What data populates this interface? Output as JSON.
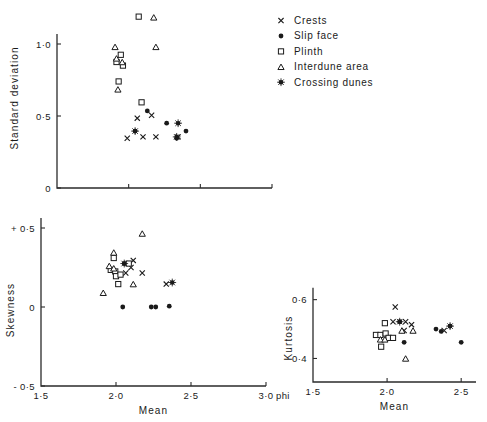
{
  "figure": {
    "title": "",
    "phi_unit": "phi"
  },
  "legend": {
    "position": "top-right",
    "items": [
      {
        "label": "Crests",
        "marker": "cross-x",
        "icon": "x-marker-icon"
      },
      {
        "label": "Slip face",
        "marker": "filled-circle",
        "icon": "filled-circle-icon"
      },
      {
        "label": "Plinth",
        "marker": "open-square",
        "icon": "open-square-icon"
      },
      {
        "label": "Interdune area",
        "marker": "open-triangle",
        "icon": "open-triangle-icon"
      },
      {
        "label": "Crossing dunes",
        "marker": "star-dot",
        "icon": "star-dot-icon"
      }
    ]
  },
  "chart_data": [
    {
      "id": "standard-deviation",
      "type": "scatter",
      "title": "",
      "xlabel": "",
      "ylabel": "Standard  deviation",
      "xlim": [
        1.5,
        3.0
      ],
      "ylim": [
        0.0,
        1.25
      ],
      "xticks": [
        1.5,
        2.0,
        2.5,
        3.0
      ],
      "xticklabels": [
        "",
        "",
        "",
        ""
      ],
      "yticks": [
        0.0,
        0.5,
        1.0
      ],
      "yticklabels": [
        "0",
        "0·5",
        "1·0"
      ],
      "grid": false,
      "series": [
        {
          "name": "Crests",
          "marker": "cross-x",
          "points": [
            [
              2.06,
              0.485
            ],
            [
              2.16,
              0.505
            ],
            [
              1.99,
              0.345
            ],
            [
              2.1,
              0.355
            ],
            [
              2.19,
              0.355
            ],
            [
              2.345,
              0.355
            ]
          ]
        },
        {
          "name": "Slip face",
          "marker": "filled-circle",
          "points": [
            [
              2.13,
              0.535
            ],
            [
              2.045,
              0.395
            ],
            [
              2.265,
              0.45
            ],
            [
              2.335,
              0.345
            ],
            [
              2.4,
              0.395
            ]
          ]
        },
        {
          "name": "Plinth",
          "marker": "open-square",
          "points": [
            [
              2.07,
              1.19
            ],
            [
              1.945,
              0.925
            ],
            [
              1.915,
              0.875
            ],
            [
              1.96,
              0.85
            ],
            [
              1.93,
              0.74
            ],
            [
              2.09,
              0.595
            ]
          ]
        },
        {
          "name": "Interdune area",
          "marker": "open-triangle",
          "points": [
            [
              2.175,
              1.185
            ],
            [
              1.905,
              0.98
            ],
            [
              2.19,
              0.98
            ],
            [
              1.915,
              0.9
            ],
            [
              1.955,
              0.875
            ],
            [
              1.925,
              0.685
            ]
          ]
        },
        {
          "name": "Crossing dunes",
          "marker": "star-dot",
          "points": [
            [
              2.045,
              0.395
            ],
            [
              2.335,
              0.355
            ],
            [
              2.345,
              0.45
            ]
          ]
        }
      ]
    },
    {
      "id": "skewness",
      "type": "scatter",
      "title": "",
      "xlabel": "Mean",
      "ylabel": "Skewness",
      "xlim": [
        1.5,
        3.0
      ],
      "ylim": [
        -0.5,
        0.5
      ],
      "xticks": [
        1.5,
        2.0,
        2.5,
        3.0
      ],
      "xticklabels": [
        "1·5",
        "2·0",
        "2·5",
        "3·0"
      ],
      "yticks": [
        -0.5,
        0.0,
        0.5
      ],
      "yticklabels": [
        "- 0·5",
        "0",
        "+ 0·5"
      ],
      "grid": false,
      "series": [
        {
          "name": "Crests",
          "marker": "cross-x",
          "points": [
            [
              2.115,
              0.295
            ],
            [
              2.1,
              0.25
            ],
            [
              2.065,
              0.215
            ],
            [
              2.175,
              0.215
            ],
            [
              2.335,
              0.145
            ]
          ]
        },
        {
          "name": "Slip face",
          "marker": "filled-circle",
          "points": [
            [
              2.055,
              0.275
            ],
            [
              2.045,
              0.0
            ],
            [
              2.235,
              0.0
            ],
            [
              2.265,
              0.0
            ],
            [
              2.355,
              0.005
            ]
          ]
        },
        {
          "name": "Plinth",
          "marker": "open-square",
          "points": [
            [
              1.985,
              0.31
            ],
            [
              1.965,
              0.235
            ],
            [
              1.995,
              0.225
            ],
            [
              2.0,
              0.195
            ],
            [
              2.085,
              0.275
            ],
            [
              2.03,
              0.205
            ],
            [
              2.015,
              0.145
            ]
          ]
        },
        {
          "name": "Interdune area",
          "marker": "open-triangle",
          "points": [
            [
              2.175,
              0.465
            ],
            [
              1.985,
              0.345
            ],
            [
              1.955,
              0.26
            ],
            [
              1.985,
              0.245
            ],
            [
              2.115,
              0.145
            ],
            [
              1.915,
              0.09
            ]
          ]
        },
        {
          "name": "Crossing dunes",
          "marker": "star-dot",
          "points": [
            [
              2.055,
              0.275
            ],
            [
              2.375,
              0.155
            ]
          ]
        }
      ]
    },
    {
      "id": "kurtosis",
      "type": "scatter",
      "title": "",
      "xlabel": "Mean",
      "ylabel": "Kurtosis",
      "xlim": [
        1.5,
        2.6
      ],
      "ylim": [
        0.32,
        0.66
      ],
      "xticks": [
        1.5,
        2.0,
        2.5
      ],
      "xticklabels": [
        "1·5",
        "2·0",
        "2·5"
      ],
      "yticks": [
        0.4,
        0.6
      ],
      "yticklabels": [
        "0·4",
        "0·6"
      ],
      "grid": false,
      "series": [
        {
          "name": "Crests",
          "marker": "cross-x",
          "points": [
            [
              2.055,
              0.575
            ],
            [
              2.04,
              0.525
            ],
            [
              2.125,
              0.525
            ],
            [
              2.165,
              0.515
            ],
            [
              2.115,
              0.495
            ],
            [
              2.385,
              0.495
            ]
          ]
        },
        {
          "name": "Slip face",
          "marker": "filled-circle",
          "points": [
            [
              2.085,
              0.525
            ],
            [
              2.115,
              0.455
            ],
            [
              2.33,
              0.5
            ],
            [
              2.365,
              0.492
            ],
            [
              2.425,
              0.51
            ],
            [
              2.5,
              0.455
            ]
          ]
        },
        {
          "name": "Plinth",
          "marker": "open-square",
          "points": [
            [
              1.985,
              0.52
            ],
            [
              1.925,
              0.48
            ],
            [
              1.955,
              0.48
            ],
            [
              1.99,
              0.485
            ],
            [
              2.01,
              0.47
            ],
            [
              2.04,
              0.47
            ],
            [
              1.96,
              0.44
            ]
          ]
        },
        {
          "name": "Interdune area",
          "marker": "open-triangle",
          "points": [
            [
              2.1,
              0.495
            ],
            [
              2.175,
              0.495
            ],
            [
              1.955,
              0.465
            ],
            [
              1.985,
              0.465
            ],
            [
              2.125,
              0.4
            ]
          ]
        },
        {
          "name": "Crossing dunes",
          "marker": "star-dot",
          "points": [
            [
              2.085,
              0.525
            ],
            [
              2.425,
              0.51
            ]
          ]
        }
      ]
    }
  ]
}
